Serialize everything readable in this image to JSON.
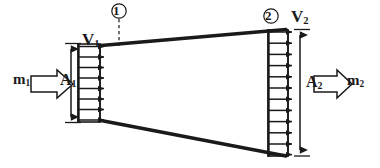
{
  "figure": {
    "type": "engineering-diagram",
    "background_color": "#ffffff",
    "line_color": "#1a1a1a",
    "width": 380,
    "height": 168
  },
  "labels": {
    "inlet_velocity": {
      "symbol": "V",
      "subscript": "1"
    },
    "inlet_area": {
      "symbol": "A",
      "subscript": "1"
    },
    "inlet_massflow": {
      "symbol": "m",
      "subscript": "1"
    },
    "outlet_velocity": {
      "symbol": "V",
      "subscript": "2"
    },
    "outlet_area": {
      "symbol": "A",
      "subscript": "2"
    },
    "outlet_massflow": {
      "symbol": "m",
      "subscript": "2"
    },
    "station_1": "1",
    "station_2": "2"
  },
  "geometry": {
    "inlet": {
      "x": 100,
      "top_y": 44,
      "bottom_y": 122,
      "arrow_count": 8,
      "box_left_x": 78,
      "velocity_arrow_length": 30
    },
    "outlet": {
      "x": 288,
      "top_y": 30,
      "bottom_y": 155,
      "arrow_count": 12,
      "box_left_x": 268,
      "velocity_arrow_length": 28
    },
    "walls": {
      "top": {
        "x1": 102,
        "y1": 45,
        "x2": 285,
        "y2": 29
      },
      "bottom": {
        "x1": 102,
        "y1": 121,
        "x2": 285,
        "y2": 156
      },
      "stroke_width": 3.4
    },
    "station_1_dashed_line": {
      "x": 119,
      "y1": 17,
      "y2": 46
    },
    "dimension_a1": {
      "x": 71,
      "y1": 43,
      "y2": 123
    },
    "dimension_a2": {
      "x": 300,
      "y1": 29,
      "y2": 156
    },
    "block_arrow_inlet": {
      "x": 30,
      "y": 84,
      "length": 45
    },
    "block_arrow_outlet": {
      "x": 313,
      "y": 84,
      "length": 42
    }
  }
}
